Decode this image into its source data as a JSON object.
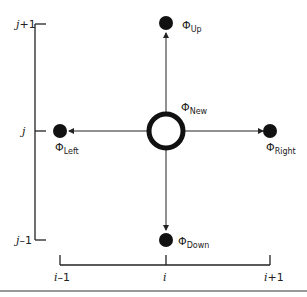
{
  "diagram": {
    "nodes": {
      "new": {
        "symbol": "Φ",
        "subscript": "New"
      },
      "up": {
        "symbol": "Φ",
        "subscript": "Up"
      },
      "down": {
        "symbol": "Φ",
        "subscript": "Down"
      },
      "left": {
        "symbol": "Φ",
        "subscript": "Left"
      },
      "right": {
        "symbol": "Φ",
        "subscript": "Right"
      }
    },
    "y_axis": {
      "ticks": [
        {
          "var": "j",
          "suffix": "+1"
        },
        {
          "var": "j",
          "suffix": ""
        },
        {
          "var": "j",
          "suffix": "–1"
        }
      ]
    },
    "x_axis": {
      "ticks": [
        {
          "var": "i",
          "suffix": "–1"
        },
        {
          "var": "i",
          "suffix": ""
        },
        {
          "var": "i",
          "suffix": "+1"
        }
      ]
    },
    "colors": {
      "ink": "#111111",
      "rule": "#999999"
    }
  }
}
